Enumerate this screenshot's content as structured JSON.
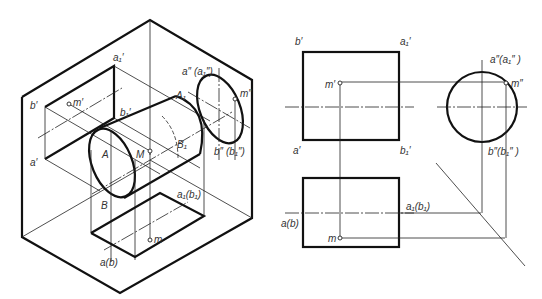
{
  "figure": {
    "type": "projection-diagram"
  },
  "isometric": {
    "labels": {
      "a1_prime": "a₁′",
      "b_prime": "b′",
      "m_prime": "m′",
      "b1_prime": "b₁′",
      "a_prime": "a′",
      "a_dbl_a1_dbl": "a″ (a₁″)",
      "m_dbl": "m″",
      "A1": "A₁",
      "A": "A",
      "M": "M",
      "B1": "B₁",
      "b_dbl_b1_dbl": "b″ (b₁″)",
      "B": "B",
      "a1_b1": "a₁(b₁)",
      "m": "m",
      "a_b": "a(b)"
    }
  },
  "front_view": {
    "labels": {
      "b_prime": "b′",
      "a1_prime": "a₁′",
      "m_prime": "m′",
      "a_prime": "a′",
      "b1_prime": "b₁′"
    }
  },
  "side_view": {
    "labels": {
      "a_dbl_a1_dbl": "a″(a₁″ )",
      "m_dbl": "m″",
      "b_dbl_b1_dbl": "b″(b₁″ )"
    }
  },
  "top_view": {
    "labels": {
      "a1_b1": "a₁(b₁)",
      "a_b": "a(b)",
      "m": "m"
    }
  }
}
